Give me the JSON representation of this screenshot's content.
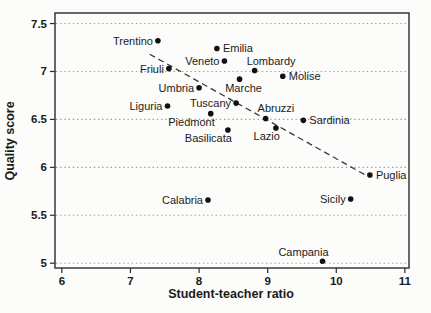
{
  "chart_data": {
    "type": "scatter",
    "title": "",
    "xlabel": "Student-teacher ratio",
    "ylabel": "Quality score",
    "x_ticks": [
      "6",
      "7",
      "8",
      "9",
      "10",
      "11"
    ],
    "x_tick_values": [
      6,
      7,
      8,
      9,
      10,
      11
    ],
    "y_ticks": [
      "5",
      "5.5",
      "6",
      "6.5",
      "7",
      "7.5"
    ],
    "y_tick_values": [
      5,
      5.5,
      6,
      6.5,
      7,
      7.5
    ],
    "axis_range": {
      "x": [
        5.9,
        11.06
      ],
      "y": [
        4.95,
        7.61
      ]
    },
    "grid": {
      "horizontal": true,
      "vertical": false,
      "style": "dotted",
      "legend": "none"
    },
    "points": [
      {
        "label": "Trentino",
        "x": 7.4,
        "y": 7.32,
        "label_pos": "left"
      },
      {
        "label": "Emilia",
        "x": 8.26,
        "y": 7.24,
        "label_pos": "right"
      },
      {
        "label": "Veneto",
        "x": 8.37,
        "y": 7.11,
        "label_pos": "left"
      },
      {
        "label": "Friuli",
        "x": 7.56,
        "y": 7.03,
        "label_pos": "left"
      },
      {
        "label": "Lombardy",
        "x": 8.81,
        "y": 7.01,
        "label_pos": "above-right"
      },
      {
        "label": "Molise",
        "x": 9.22,
        "y": 6.95,
        "label_pos": "right"
      },
      {
        "label": "Marche",
        "x": 8.59,
        "y": 6.92,
        "label_pos": "below"
      },
      {
        "label": "Umbria",
        "x": 8.0,
        "y": 6.83,
        "label_pos": "left"
      },
      {
        "label": "Tuscany",
        "x": 8.54,
        "y": 6.67,
        "label_pos": "left"
      },
      {
        "label": "Liguria",
        "x": 7.54,
        "y": 6.64,
        "label_pos": "left"
      },
      {
        "label": "Piedmont",
        "x": 8.17,
        "y": 6.56,
        "label_pos": "below-left"
      },
      {
        "label": "Abruzzi",
        "x": 8.97,
        "y": 6.51,
        "label_pos": "above-right"
      },
      {
        "label": "Sardinia",
        "x": 9.52,
        "y": 6.49,
        "label_pos": "right"
      },
      {
        "label": "Lazio",
        "x": 9.12,
        "y": 6.41,
        "label_pos": "below-left"
      },
      {
        "label": "Basilicata",
        "x": 8.42,
        "y": 6.39,
        "label_pos": "below-left"
      },
      {
        "label": "Puglia",
        "x": 10.49,
        "y": 5.92,
        "label_pos": "right"
      },
      {
        "label": "Sicily",
        "x": 10.21,
        "y": 5.67,
        "label_pos": "left"
      },
      {
        "label": "Calabria",
        "x": 8.13,
        "y": 5.66,
        "label_pos": "left"
      },
      {
        "label": "Campania",
        "x": 9.8,
        "y": 5.02,
        "label_pos": "above-left"
      }
    ],
    "trend_line": {
      "style": "dashed",
      "x1": 7.28,
      "y1": 7.18,
      "x2": 10.45,
      "y2": 5.91
    }
  },
  "colors": {
    "background": "#fcfcfa",
    "ink": "#1b1b1b",
    "frame": "#2b2b2b",
    "grid": "#a0a09e",
    "trend": "#3a3a3a",
    "point": "#111111"
  }
}
